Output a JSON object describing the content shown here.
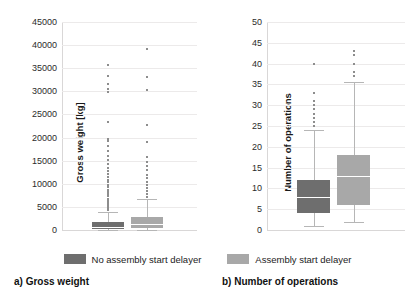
{
  "figure": {
    "background": "#ffffff",
    "colors": {
      "no_delayer": "#6e6e6e",
      "delayer": "#a8a8a8",
      "whisker": "#b6b6b6",
      "grid": "#eceaea",
      "text": "#1a1a1a"
    }
  },
  "legend": {
    "items": [
      {
        "label": "No assembly start delayer",
        "color": "#6e6e6e",
        "key": "no_delayer"
      },
      {
        "label": "Assembly start delayer",
        "color": "#a8a8a8",
        "key": "delayer"
      }
    ]
  },
  "captions": {
    "a": "a) Gross weight",
    "b": "b) Number of operations"
  },
  "chart_data": [
    {
      "id": "gross-weight",
      "type": "box",
      "title": "a) Gross weight",
      "xlabel": "",
      "ylabel": "Gross weight [kg]",
      "ylim": [
        0,
        45000
      ],
      "ytick_step": 5000,
      "yticks": [
        0,
        5000,
        10000,
        15000,
        20000,
        25000,
        30000,
        35000,
        40000,
        45000
      ],
      "grid": true,
      "legend_position": "bottom-center",
      "series": [
        {
          "name": "No assembly start delayer",
          "color": "#6e6e6e",
          "whisker_low": 0,
          "q1": 300,
          "median": 700,
          "q3": 1800,
          "whisker_high": 3900,
          "outliers": [
            4400,
            4800,
            5200,
            5600,
            6000,
            6400,
            6800,
            7300,
            7700,
            8200,
            8700,
            9200,
            9800,
            10300,
            10900,
            11500,
            12100,
            12800,
            13500,
            14300,
            15100,
            16000,
            17000,
            18100,
            19300,
            19700,
            23300,
            29800,
            30600,
            31500,
            33300,
            35700
          ]
        },
        {
          "name": "Assembly start delayer",
          "color": "#a8a8a8",
          "whisker_low": 0,
          "q1": 500,
          "median": 1200,
          "q3": 2900,
          "whisker_high": 6700,
          "outliers": [
            7200,
            7800,
            8400,
            9000,
            9700,
            10400,
            11200,
            12000,
            12900,
            13800,
            14800,
            15900,
            19000,
            22800,
            30300,
            33000,
            39200
          ]
        }
      ]
    },
    {
      "id": "number-of-operations",
      "type": "box",
      "title": "b) Number of operations",
      "xlabel": "",
      "ylabel": "Number of operations",
      "ylim": [
        0,
        50
      ],
      "ytick_step": 5,
      "yticks": [
        0,
        5,
        10,
        15,
        20,
        25,
        30,
        35,
        40,
        45,
        50
      ],
      "grid": true,
      "legend_position": "bottom-center",
      "series": [
        {
          "name": "No assembly start delayer",
          "color": "#6e6e6e",
          "whisker_low": 1,
          "q1": 4,
          "median": 8,
          "q3": 12,
          "whisker_high": 24,
          "outliers": [
            25,
            26,
            27,
            28,
            29,
            30,
            31,
            33,
            40
          ]
        },
        {
          "name": "Assembly start delayer",
          "color": "#a8a8a8",
          "whisker_low": 2,
          "q1": 6,
          "median": 13,
          "q3": 18,
          "whisker_high": 35.5,
          "outliers": [
            37,
            38,
            40,
            42,
            43
          ]
        }
      ]
    }
  ]
}
